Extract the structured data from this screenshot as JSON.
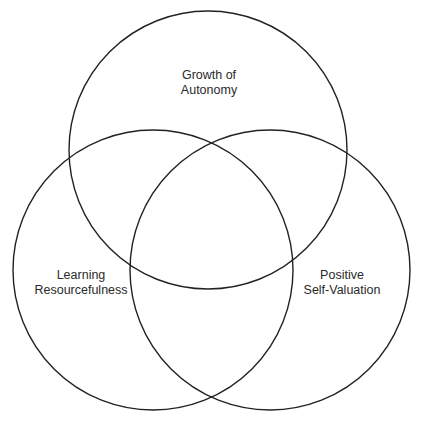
{
  "diagram": {
    "type": "venn",
    "stroke_color": "#222222",
    "background": "#ffffff",
    "sets": [
      {
        "id": "growth",
        "line1": "Growth of",
        "line2": "Autonomy",
        "cx": 208,
        "cy": 150,
        "r": 139,
        "label_x": 209,
        "label_y": 68
      },
      {
        "id": "learning",
        "line1": "Learning",
        "line2": "Resourcefulness",
        "cx": 153,
        "cy": 270,
        "r": 140,
        "label_x": 81,
        "label_y": 268
      },
      {
        "id": "positive",
        "line1": "Positive",
        "line2": "Self-Valuation",
        "cx": 270,
        "cy": 270,
        "r": 140,
        "label_x": 342,
        "label_y": 268
      }
    ]
  }
}
